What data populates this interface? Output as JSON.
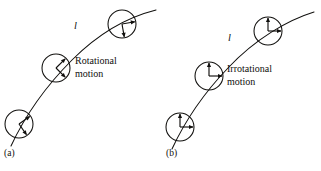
{
  "figure": {
    "type": "scientific-diagram",
    "background_color": "#ffffff",
    "ink_color": "#100f0d",
    "width": 321,
    "height": 171
  },
  "panels": [
    {
      "id": "a",
      "caption": "(a)",
      "motion_label_line1": "Rotational",
      "motion_label_line2": "motion",
      "streamline_label": "l",
      "streamline_label_name": "arc-length-l",
      "element_rotates": true,
      "elements": [
        {
          "position": "lower-left",
          "cx": 19,
          "cy": 124,
          "r": 14,
          "cross_angle_deg": 55
        },
        {
          "position": "middle",
          "cx": 56,
          "cy": 68,
          "r": 14,
          "cross_angle_deg": 45
        },
        {
          "position": "upper-right",
          "cx": 122,
          "cy": 24,
          "r": 14,
          "cross_angle_deg": 80
        }
      ]
    },
    {
      "id": "b",
      "caption": "(b)",
      "motion_label_line1": "Irrotational",
      "motion_label_line2": "motion",
      "streamline_label": "l",
      "streamline_label_name": "arc-length-l",
      "element_rotates": false,
      "elements": [
        {
          "position": "lower-left",
          "cx": 180,
          "cy": 127,
          "r": 14,
          "cross_angle_deg": 0
        },
        {
          "position": "middle",
          "cx": 209,
          "cy": 76,
          "r": 14,
          "cross_angle_deg": 0
        },
        {
          "position": "upper-right",
          "cx": 268,
          "cy": 31,
          "r": 14,
          "cross_angle_deg": 0
        }
      ]
    }
  ]
}
